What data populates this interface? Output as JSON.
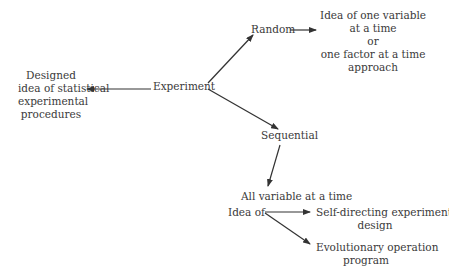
{
  "nodes": {
    "experiment": "Experiment",
    "designed": [
      "Designed",
      "idea of statistical",
      "experimental",
      "procedures"
    ],
    "random": "Random",
    "ofat": [
      "Idea of one variable",
      "at a time",
      "or",
      "one factor at a time",
      "approach"
    ],
    "sequential": "Sequential",
    "all_variable": "All variable at a time",
    "idea_of": "Idea of",
    "self_directing": [
      "Self-directing experimental",
      "design"
    ],
    "evop": [
      "Evolutionary operation",
      "program"
    ]
  },
  "edges": [
    {
      "from": "experiment",
      "to": "designed"
    },
    {
      "from": "experiment",
      "to": "random"
    },
    {
      "from": "experiment",
      "to": "sequential"
    },
    {
      "from": "random",
      "to": "ofat"
    },
    {
      "from": "sequential",
      "to": "all_variable"
    },
    {
      "from": "idea_of",
      "to": "self_directing"
    },
    {
      "from": "idea_of",
      "to": "evop"
    }
  ],
  "colors": {
    "line": "#333333",
    "text": "#3a3a3a"
  }
}
